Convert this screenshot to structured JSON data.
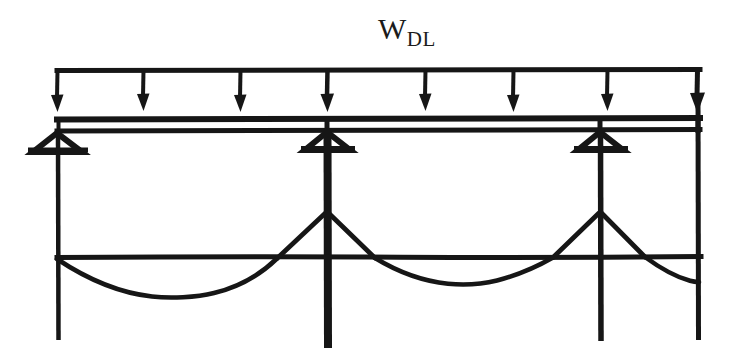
{
  "figure": {
    "background_color": "#ffffff",
    "ink_color": "#161616",
    "width": 734,
    "height": 356
  },
  "labels": {
    "load_symbol_main": "W",
    "load_symbol_subscript": "DL"
  },
  "load": {
    "type": "uniformly-distributed-load",
    "line_y": 70,
    "line_x_start": 57,
    "line_x_end": 700,
    "arrow_tip_y": 112,
    "arrow_count": 8,
    "arrow_x_positions": [
      57,
      143,
      240,
      327,
      425,
      513,
      607,
      697
    ]
  },
  "beam": {
    "top_line_y": 119,
    "bottom_line_y": 130,
    "x_start": 57,
    "x_end": 700,
    "thickness": 5
  },
  "supports": [
    {
      "name": "support-left",
      "x": 57,
      "y": 131,
      "column_bottom": 340,
      "column_width": 4
    },
    {
      "name": "support-middle",
      "x": 327,
      "y": 131,
      "column_bottom": 348,
      "column_width": 8
    },
    {
      "name": "support-right",
      "x": 600,
      "y": 131,
      "column_bottom": 340,
      "column_width": 5
    }
  ],
  "columns": [
    {
      "name": "column-left",
      "x": 57,
      "top": 131,
      "bottom": 340,
      "width": 4
    },
    {
      "name": "column-middle",
      "x": 327,
      "top": 131,
      "bottom": 348,
      "width": 8
    },
    {
      "name": "column-right-inner",
      "x": 600,
      "top": 131,
      "bottom": 340,
      "width": 5
    },
    {
      "name": "column-right-end",
      "x": 697,
      "top": 95,
      "bottom": 340,
      "width": 5
    }
  ],
  "moment_diagram": {
    "baseline_y": 257,
    "baseline_x_start": 57,
    "baseline_x_end": 700,
    "hogging_peaks": [
      {
        "x": 327,
        "y": 212
      },
      {
        "x": 600,
        "y": 213
      }
    ],
    "sagging_minima": [
      {
        "x": 185,
        "y": 297
      },
      {
        "x": 465,
        "y": 284
      },
      {
        "x": 670,
        "y": 281
      }
    ],
    "zero_crossings": [
      57,
      277,
      375,
      553,
      645
    ],
    "curve_style": "hand-drawn"
  }
}
